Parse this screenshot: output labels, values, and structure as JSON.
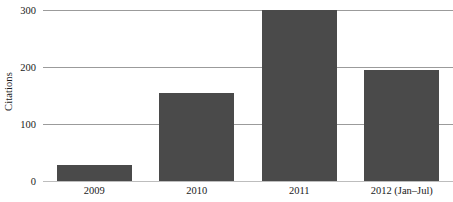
{
  "chart_data": {
    "type": "bar",
    "title": "",
    "subtitle": "",
    "xlabel": "",
    "ylabel": "Citations",
    "categories": [
      "2009",
      "2010",
      "2011",
      "2012 (Jan–Jul)"
    ],
    "values": [
      28,
      154,
      300,
      194
    ],
    "series": [
      {
        "name": "Citations",
        "values": [
          28,
          154,
          300,
          194
        ]
      }
    ],
    "ylim": [
      0,
      300
    ],
    "yticks": [
      0,
      100,
      200,
      300
    ],
    "ytick_labels": [
      "0",
      "100",
      "200",
      "300"
    ],
    "grid": true,
    "grid_axis": "y",
    "legend": false,
    "legend_position": "none",
    "annotations": [],
    "colors": {
      "bar": "#4a4a4a",
      "gridline": "#9b9b9b",
      "baseline": "#bdbdbd",
      "text": "#1a1a1a",
      "background": "#ffffff"
    }
  }
}
